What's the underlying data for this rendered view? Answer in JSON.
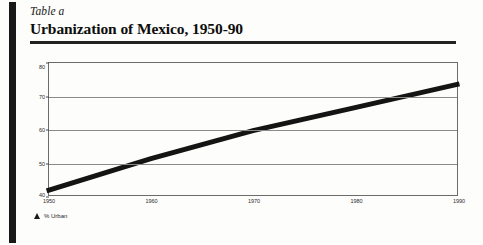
{
  "document": {
    "table_label": "Table a",
    "title": "Urbanization of Mexico, 1950-90"
  },
  "legend": {
    "marker_icon": "triangle-marker-icon",
    "label": "% Urban"
  },
  "chart_data": {
    "type": "line",
    "title": "Urbanization of Mexico, 1950-90",
    "xlabel": "",
    "ylabel": "",
    "categories": [
      "1950",
      "1960",
      "1970",
      "1980",
      "1990"
    ],
    "x": [
      1950,
      1960,
      1970,
      1980,
      1990
    ],
    "values": [
      41.5,
      51,
      59.5,
      66.5,
      73.5
    ],
    "series": [
      {
        "name": "% Urban",
        "values": [
          41.5,
          51,
          59.5,
          66.5,
          73.5
        ]
      }
    ],
    "xlim": [
      1950,
      1990
    ],
    "ylim": [
      40,
      80
    ],
    "ytick_labels": [
      "40",
      "50",
      "60",
      "70",
      "80"
    ],
    "yticks": [
      40,
      50,
      60,
      70,
      80
    ],
    "xtick_labels": [
      "1950",
      "1960",
      "1970",
      "1980",
      "1990"
    ],
    "grid": true,
    "legend_position": "below-left",
    "line_color": "#141414"
  }
}
